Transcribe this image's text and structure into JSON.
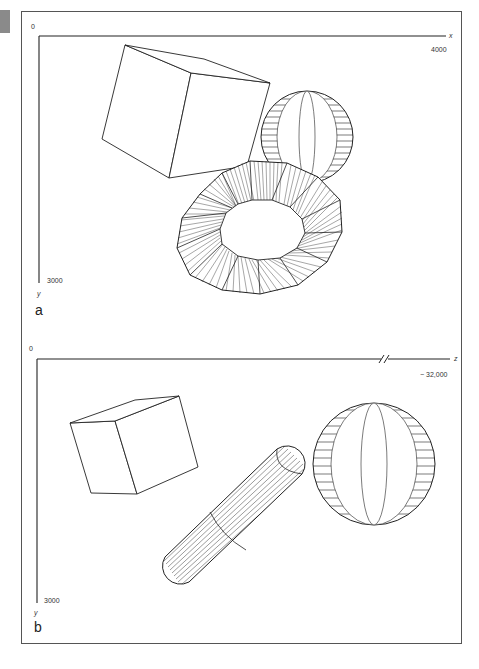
{
  "figure": {
    "panels": [
      {
        "letter": "a",
        "origin_label": "0",
        "horizontal_axis": {
          "name": "x",
          "max_label": "4000"
        },
        "vertical_axis": {
          "name": "y",
          "max_label": "3000"
        },
        "objects": [
          "cube",
          "sphere",
          "torus"
        ]
      },
      {
        "letter": "b",
        "origin_label": "0",
        "horizontal_axis": {
          "name": "z",
          "max_label": "− 32,000",
          "has_axis_break": true
        },
        "vertical_axis": {
          "name": "y",
          "max_label": "3000"
        },
        "objects": [
          "cube",
          "sphere",
          "capsule"
        ]
      }
    ]
  },
  "colors": {
    "line": "#222222",
    "frame": "#555555",
    "tab": "#8a8a8a",
    "background": "#ffffff"
  }
}
